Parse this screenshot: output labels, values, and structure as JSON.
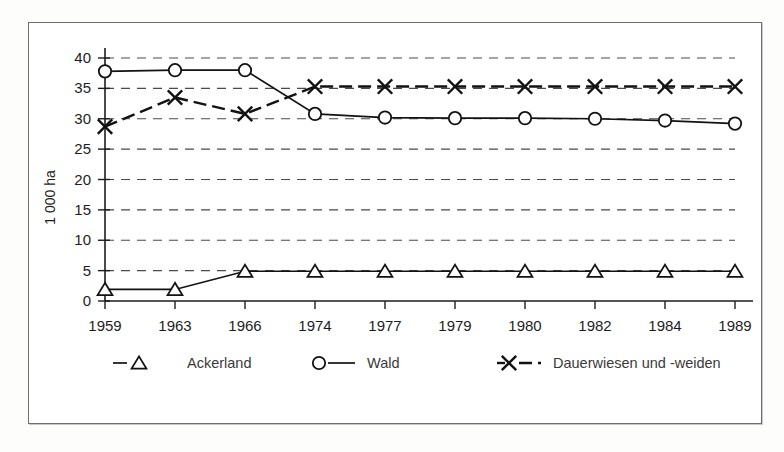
{
  "figure": {
    "ylabel": "1 000 ha",
    "frame": {
      "border_color": "#6e6e6e"
    }
  },
  "chart_data": {
    "type": "line",
    "title": "",
    "xlabel": "",
    "ylabel": "1 000 ha",
    "categories": [
      "1959",
      "1963",
      "1966",
      "1974",
      "1977",
      "1979",
      "1980",
      "1982",
      "1984",
      "1989"
    ],
    "ylim": [
      0,
      40
    ],
    "yticks": [
      0,
      5,
      10,
      15,
      20,
      25,
      30,
      35,
      40
    ],
    "grid": true,
    "legend_position": "bottom",
    "series": [
      {
        "name": "Ackerland",
        "marker": "triangle",
        "line_style": "solid",
        "values": [
          1.9,
          1.9,
          4.9,
          4.9,
          4.9,
          4.9,
          4.9,
          4.9,
          4.9,
          4.9
        ]
      },
      {
        "name": "Wald",
        "marker": "circle",
        "line_style": "solid",
        "values": [
          37.8,
          38.0,
          38.0,
          30.8,
          30.2,
          30.1,
          30.1,
          30.0,
          29.7,
          29.2
        ]
      },
      {
        "name": "Dauerwiesen und  -weiden",
        "marker": "x",
        "line_style": "dashed",
        "values": [
          28.7,
          33.5,
          30.8,
          35.3,
          35.3,
          35.3,
          35.3,
          35.3,
          35.3,
          35.3
        ]
      }
    ]
  },
  "legend": {
    "items": [
      {
        "label": "Ackerland",
        "marker": "triangle-icon",
        "line_style": "solid"
      },
      {
        "label": "Wald",
        "marker": "circle-icon",
        "line_style": "solid"
      },
      {
        "label": "Dauerwiesen und  -weiden",
        "marker": "x-icon",
        "line_style": "dashed"
      }
    ]
  }
}
